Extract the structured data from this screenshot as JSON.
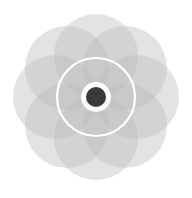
{
  "figure": {
    "canvas": {
      "width": 192,
      "height": 198,
      "background": "#ffffff"
    },
    "center": {
      "x": 96,
      "y": 97
    },
    "petal_ring": {
      "name": "petal-circles",
      "count": 8,
      "circle_radius": 42,
      "orbit_radius": 41,
      "start_angle_deg": -90,
      "fill": "#bdbdbd",
      "opacity": 0.42,
      "stroke": "none",
      "centers": [
        {
          "index": 1,
          "angle_deg": -90,
          "cx": 96,
          "cy": 56
        },
        {
          "index": 2,
          "angle_deg": -45,
          "cx": 125,
          "cy": 68
        },
        {
          "index": 3,
          "angle_deg": 0,
          "cx": 137,
          "cy": 97
        },
        {
          "index": 4,
          "angle_deg": 45,
          "cx": 125,
          "cy": 126
        },
        {
          "index": 5,
          "angle_deg": 90,
          "cx": 96,
          "cy": 138
        },
        {
          "index": 6,
          "angle_deg": 135,
          "cx": 67,
          "cy": 126
        },
        {
          "index": 7,
          "angle_deg": 180,
          "cx": 55,
          "cy": 97
        },
        {
          "index": 8,
          "angle_deg": 225,
          "cx": 67,
          "cy": 68
        }
      ]
    },
    "white_ring": {
      "name": "white-ring",
      "cx": 96,
      "cy": 97,
      "r": 39,
      "stroke": "#ffffff",
      "stroke_width": 2.2,
      "fill": "none"
    },
    "inner_halo": {
      "name": "inner-halo",
      "cx": 96,
      "cy": 97,
      "r": 15,
      "fill": "#ffffff",
      "opacity": 0.92
    },
    "center_dot": {
      "name": "center-dot",
      "cx": 96,
      "cy": 97,
      "r": 10,
      "fill": "#3a3a3a"
    },
    "palette": {
      "background": "#ffffff",
      "petal_base": "#bdbdbd",
      "petal_light": "#e8e8e8",
      "petal_mid": "#d6d6d6",
      "petal_dark": "#bfbfbf",
      "ring": "#ffffff",
      "center": "#3a3a3a"
    },
    "labels": {
      "root": "mandala-figure",
      "petal_item": "petal-circle",
      "alt_text": "Eight overlapping translucent gray circles forming a rosette, with a thin white ring and a dark center dot."
    }
  }
}
